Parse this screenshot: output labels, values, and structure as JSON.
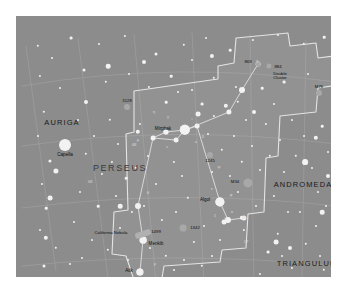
{
  "chart": {
    "background_color": "#8c8c8c",
    "star_color": "#f2f2f2",
    "boundary_color": "#e8e8e8",
    "gridline_color": "#a0a0a0",
    "figure_line_color": "#dcdcdc",
    "nebula_color": "#a8a8a8"
  },
  "constellations": [
    {
      "name": "AURIGA",
      "x": 46,
      "y": 107
    },
    {
      "name": "PERSEUS",
      "x": 104,
      "y": 152
    },
    {
      "name": "ANDROMEDA",
      "x": 287,
      "y": 169
    },
    {
      "name": "TRIANGULUM",
      "x": 291,
      "y": 248
    }
  ],
  "named_stars": [
    {
      "name": "Capella",
      "x": 49,
      "y": 129,
      "r": 6.0,
      "label_dx": 0,
      "label_dy": 10
    },
    {
      "name": "Mirphak",
      "x": 169,
      "y": 114,
      "r": 5.2,
      "label_dx": -22,
      "label_dy": -1
    },
    {
      "name": "Algol",
      "x": 204,
      "y": 186,
      "r": 4.6,
      "label_dx": -15,
      "label_dy": -2
    },
    {
      "name": "Menkib",
      "x": 127,
      "y": 224,
      "r": 3.4,
      "label_dx": 13,
      "label_dy": 4
    },
    {
      "name": "Atik",
      "x": 124,
      "y": 256,
      "r": 3.6,
      "label_dx": -11,
      "label_dy": -1
    }
  ],
  "deep_sky_objects": [
    {
      "name": "1528",
      "x": 111,
      "y": 91,
      "r": 3.0,
      "label_dx": 0,
      "label_dy": -6
    },
    {
      "name": "869",
      "x": 242,
      "y": 48,
      "r": 2.6,
      "label_dx": -10,
      "label_dy": -2
    },
    {
      "name": "884",
      "x": 253,
      "y": 50,
      "r": 2.6,
      "label_dx": 9,
      "label_dy": 1
    },
    {
      "name": "Double\nCluster",
      "x": 253,
      "y": 50,
      "r": 0,
      "label_dx": 11,
      "label_dy": 10
    },
    {
      "name": "M76",
      "x": 303,
      "y": 77,
      "r": 3.0,
      "label_dx": 0,
      "label_dy": -6
    },
    {
      "name": "1245",
      "x": 194,
      "y": 139,
      "r": 3.0,
      "label_dx": 0,
      "label_dy": 6
    },
    {
      "name": "M34",
      "x": 232,
      "y": 167,
      "r": 4.6,
      "label_dx": -13,
      "label_dy": -1
    },
    {
      "name": "1342",
      "x": 167,
      "y": 212,
      "r": 3.4,
      "label_dx": 12,
      "label_dy": 0
    },
    {
      "name": "1499",
      "x": 127,
      "y": 218,
      "r": 0,
      "label_dx": 13,
      "label_dy": -2
    },
    {
      "name": "California Nebula",
      "x": 127,
      "y": 218,
      "r": 0,
      "label_dx": -32,
      "label_dy": -1
    }
  ],
  "bayer_labels": [
    {
      "g": "γ",
      "x": 152,
      "y": 101
    },
    {
      "g": "η",
      "x": 138,
      "y": 96
    },
    {
      "g": "τ",
      "x": 157,
      "y": 124
    },
    {
      "g": "ι",
      "x": 176,
      "y": 103
    },
    {
      "g": "κ",
      "x": 180,
      "y": 126
    },
    {
      "g": "δ",
      "x": 187,
      "y": 121
    },
    {
      "g": "ε",
      "x": 196,
      "y": 173
    },
    {
      "g": "ν",
      "x": 151,
      "y": 131
    },
    {
      "g": "μ",
      "x": 122,
      "y": 124
    },
    {
      "g": "ψ",
      "x": 203,
      "y": 151
    },
    {
      "g": "ξ",
      "x": 199,
      "y": 200
    },
    {
      "g": "ζ",
      "x": 209,
      "y": 203
    },
    {
      "g": "ο",
      "x": 216,
      "y": 196
    },
    {
      "g": "ρ",
      "x": 139,
      "y": 248
    },
    {
      "g": "φ",
      "x": 215,
      "y": 179
    },
    {
      "g": "θ",
      "x": 132,
      "y": 177
    },
    {
      "g": "χ",
      "x": 241,
      "y": 45
    },
    {
      "g": "48",
      "x": 118,
      "y": 129
    },
    {
      "g": "58",
      "x": 74,
      "y": 166
    },
    {
      "g": "16",
      "x": 228,
      "y": 202
    },
    {
      "g": "17",
      "x": 230,
      "y": 226
    },
    {
      "g": "b",
      "x": 129,
      "y": 263
    }
  ],
  "field_stars": [
    {
      "x": 22,
      "y": 30,
      "r": 1.2
    },
    {
      "x": 55,
      "y": 22,
      "r": 1.4
    },
    {
      "x": 83,
      "y": 28,
      "r": 1.0
    },
    {
      "x": 109,
      "y": 20,
      "r": 1.1
    },
    {
      "x": 140,
      "y": 38,
      "r": 1.5
    },
    {
      "x": 168,
      "y": 29,
      "r": 1.2
    },
    {
      "x": 190,
      "y": 22,
      "r": 1.0
    },
    {
      "x": 214,
      "y": 34,
      "r": 1.3
    },
    {
      "x": 237,
      "y": 24,
      "r": 1.1
    },
    {
      "x": 262,
      "y": 19,
      "r": 1.0
    },
    {
      "x": 288,
      "y": 28,
      "r": 1.2
    },
    {
      "x": 308,
      "y": 21,
      "r": 1.3
    },
    {
      "x": 24,
      "y": 60,
      "r": 1.1
    },
    {
      "x": 44,
      "y": 72,
      "r": 1.0
    },
    {
      "x": 68,
      "y": 54,
      "r": 1.5
    },
    {
      "x": 90,
      "y": 66,
      "r": 1.2
    },
    {
      "x": 113,
      "y": 58,
      "r": 1.0
    },
    {
      "x": 133,
      "y": 71,
      "r": 1.1
    },
    {
      "x": 155,
      "y": 60,
      "r": 1.3
    },
    {
      "x": 176,
      "y": 74,
      "r": 1.0
    },
    {
      "x": 198,
      "y": 62,
      "r": 1.2
    },
    {
      "x": 220,
      "y": 71,
      "r": 1.1
    },
    {
      "x": 268,
      "y": 66,
      "r": 1.4
    },
    {
      "x": 292,
      "y": 58,
      "r": 1.0
    },
    {
      "x": 28,
      "y": 96,
      "r": 1.2
    },
    {
      "x": 22,
      "y": 120,
      "r": 1.0
    },
    {
      "x": 34,
      "y": 145,
      "r": 1.6
    },
    {
      "x": 26,
      "y": 168,
      "r": 1.1
    },
    {
      "x": 30,
      "y": 192,
      "r": 1.3
    },
    {
      "x": 24,
      "y": 214,
      "r": 1.0
    },
    {
      "x": 40,
      "y": 232,
      "r": 1.2
    },
    {
      "x": 28,
      "y": 250,
      "r": 1.5
    },
    {
      "x": 54,
      "y": 248,
      "r": 1.0
    },
    {
      "x": 62,
      "y": 104,
      "r": 1.1
    },
    {
      "x": 78,
      "y": 120,
      "r": 1.0
    },
    {
      "x": 70,
      "y": 138,
      "r": 1.2
    },
    {
      "x": 86,
      "y": 158,
      "r": 1.1
    },
    {
      "x": 64,
      "y": 176,
      "r": 1.0
    },
    {
      "x": 82,
      "y": 190,
      "r": 1.3
    },
    {
      "x": 58,
      "y": 206,
      "r": 1.0
    },
    {
      "x": 76,
      "y": 224,
      "r": 1.1
    },
    {
      "x": 66,
      "y": 242,
      "r": 1.0
    },
    {
      "x": 94,
      "y": 104,
      "r": 1.2
    },
    {
      "x": 102,
      "y": 128,
      "r": 1.0
    },
    {
      "x": 96,
      "y": 146,
      "r": 1.1
    },
    {
      "x": 110,
      "y": 162,
      "r": 1.3
    },
    {
      "x": 100,
      "y": 180,
      "r": 1.0
    },
    {
      "x": 116,
      "y": 196,
      "r": 1.1
    },
    {
      "x": 104,
      "y": 212,
      "r": 1.0
    },
    {
      "x": 92,
      "y": 234,
      "r": 1.2
    },
    {
      "x": 112,
      "y": 244,
      "r": 1.0
    },
    {
      "x": 124,
      "y": 108,
      "r": 1.1
    },
    {
      "x": 132,
      "y": 140,
      "r": 1.0
    },
    {
      "x": 120,
      "y": 152,
      "r": 1.2
    },
    {
      "x": 140,
      "y": 168,
      "r": 1.1
    },
    {
      "x": 128,
      "y": 190,
      "r": 1.0
    },
    {
      "x": 146,
      "y": 204,
      "r": 1.1
    },
    {
      "x": 134,
      "y": 232,
      "r": 1.0
    },
    {
      "x": 150,
      "y": 240,
      "r": 1.2
    },
    {
      "x": 158,
      "y": 254,
      "r": 1.0
    },
    {
      "x": 150,
      "y": 86,
      "r": 1.3
    },
    {
      "x": 162,
      "y": 76,
      "r": 1.0
    },
    {
      "x": 158,
      "y": 146,
      "r": 1.1
    },
    {
      "x": 166,
      "y": 160,
      "r": 1.0
    },
    {
      "x": 172,
      "y": 182,
      "r": 1.2
    },
    {
      "x": 160,
      "y": 196,
      "r": 1.0
    },
    {
      "x": 178,
      "y": 226,
      "r": 1.1
    },
    {
      "x": 168,
      "y": 244,
      "r": 1.0
    },
    {
      "x": 186,
      "y": 250,
      "r": 1.2
    },
    {
      "x": 186,
      "y": 88,
      "r": 1.4
    },
    {
      "x": 198,
      "y": 100,
      "r": 1.1
    },
    {
      "x": 192,
      "y": 118,
      "r": 1.0
    },
    {
      "x": 206,
      "y": 134,
      "r": 1.2
    },
    {
      "x": 196,
      "y": 156,
      "r": 1.0
    },
    {
      "x": 214,
      "y": 160,
      "r": 1.1
    },
    {
      "x": 188,
      "y": 210,
      "r": 1.0
    },
    {
      "x": 204,
      "y": 224,
      "r": 1.1
    },
    {
      "x": 196,
      "y": 240,
      "r": 1.0
    },
    {
      "x": 222,
      "y": 86,
      "r": 1.2
    },
    {
      "x": 230,
      "y": 104,
      "r": 1.0
    },
    {
      "x": 218,
      "y": 120,
      "r": 1.1
    },
    {
      "x": 236,
      "y": 130,
      "r": 1.0
    },
    {
      "x": 226,
      "y": 146,
      "r": 1.2
    },
    {
      "x": 244,
      "y": 154,
      "r": 1.0
    },
    {
      "x": 222,
      "y": 176,
      "r": 1.1
    },
    {
      "x": 240,
      "y": 190,
      "r": 1.0
    },
    {
      "x": 228,
      "y": 214,
      "r": 1.1
    },
    {
      "x": 246,
      "y": 72,
      "r": 1.3
    },
    {
      "x": 258,
      "y": 88,
      "r": 1.0
    },
    {
      "x": 250,
      "y": 108,
      "r": 1.1
    },
    {
      "x": 264,
      "y": 124,
      "r": 1.0
    },
    {
      "x": 254,
      "y": 140,
      "r": 1.2
    },
    {
      "x": 268,
      "y": 156,
      "r": 1.0
    },
    {
      "x": 258,
      "y": 180,
      "r": 1.1
    },
    {
      "x": 272,
      "y": 196,
      "r": 1.0
    },
    {
      "x": 262,
      "y": 218,
      "r": 1.2
    },
    {
      "x": 276,
      "y": 104,
      "r": 1.1
    },
    {
      "x": 288,
      "y": 120,
      "r": 1.0
    },
    {
      "x": 280,
      "y": 140,
      "r": 1.2
    },
    {
      "x": 296,
      "y": 152,
      "r": 1.0
    },
    {
      "x": 284,
      "y": 196,
      "r": 1.1
    },
    {
      "x": 300,
      "y": 210,
      "r": 1.0
    },
    {
      "x": 290,
      "y": 228,
      "r": 1.2
    },
    {
      "x": 304,
      "y": 240,
      "r": 1.0
    },
    {
      "x": 276,
      "y": 252,
      "r": 1.1
    },
    {
      "x": 306,
      "y": 110,
      "r": 1.3
    },
    {
      "x": 312,
      "y": 136,
      "r": 1.0
    },
    {
      "x": 302,
      "y": 176,
      "r": 1.1
    },
    {
      "x": 310,
      "y": 190,
      "r": 1.0
    },
    {
      "x": 308,
      "y": 254,
      "r": 1.2
    },
    {
      "x": 292,
      "y": 268,
      "r": 1.0
    },
    {
      "x": 46,
      "y": 262,
      "r": 1.1
    },
    {
      "x": 88,
      "y": 268,
      "r": 1.0
    },
    {
      "x": 140,
      "y": 272,
      "r": 1.2
    },
    {
      "x": 200,
      "y": 266,
      "r": 1.0
    },
    {
      "x": 244,
      "y": 258,
      "r": 1.1
    },
    {
      "x": 176,
      "y": 44,
      "r": 1.0
    },
    {
      "x": 36,
      "y": 42,
      "r": 1.0
    },
    {
      "x": 252,
      "y": 236,
      "r": 1.4
    },
    {
      "x": 266,
      "y": 240,
      "r": 1.0
    }
  ],
  "bright_field_stars": [
    {
      "x": 40,
      "y": 155,
      "r": 2.6
    },
    {
      "x": 34,
      "y": 182,
      "r": 2.4
    },
    {
      "x": 30,
      "y": 222,
      "r": 2.2
    },
    {
      "x": 92,
      "y": 50,
      "r": 2.3
    },
    {
      "x": 128,
      "y": 46,
      "r": 2.0
    },
    {
      "x": 196,
      "y": 40,
      "r": 2.1
    },
    {
      "x": 289,
      "y": 146,
      "r": 2.9
    },
    {
      "x": 300,
      "y": 122,
      "r": 2.2
    },
    {
      "x": 312,
      "y": 160,
      "r": 2.0
    },
    {
      "x": 260,
      "y": 226,
      "r": 2.4
    },
    {
      "x": 274,
      "y": 232,
      "r": 2.0
    },
    {
      "x": 306,
      "y": 196,
      "r": 2.3
    },
    {
      "x": 182,
      "y": 98,
      "r": 2.4
    },
    {
      "x": 210,
      "y": 90,
      "r": 2.2
    },
    {
      "x": 238,
      "y": 96,
      "r": 2.0
    },
    {
      "x": 150,
      "y": 116,
      "r": 2.5
    },
    {
      "x": 122,
      "y": 116,
      "r": 2.2
    },
    {
      "x": 104,
      "y": 190,
      "r": 2.3
    },
    {
      "x": 208,
      "y": 206,
      "r": 2.4
    },
    {
      "x": 226,
      "y": 202,
      "r": 2.2
    },
    {
      "x": 70,
      "y": 86,
      "r": 2.0
    }
  ],
  "figure_stars": [
    {
      "x": 242,
      "y": 48,
      "r": 2.4
    },
    {
      "x": 226,
      "y": 74,
      "r": 3.0
    },
    {
      "x": 213,
      "y": 96,
      "r": 2.6
    },
    {
      "x": 169,
      "y": 114,
      "r": 5.2
    },
    {
      "x": 150,
      "y": 116,
      "r": 2.6
    },
    {
      "x": 137,
      "y": 122,
      "r": 2.4
    },
    {
      "x": 122,
      "y": 190,
      "r": 3.0
    },
    {
      "x": 127,
      "y": 224,
      "r": 3.4
    },
    {
      "x": 124,
      "y": 256,
      "r": 3.6
    },
    {
      "x": 204,
      "y": 186,
      "r": 4.6
    },
    {
      "x": 212,
      "y": 204,
      "r": 3.0
    },
    {
      "x": 228,
      "y": 202,
      "r": 2.6
    },
    {
      "x": 160,
      "y": 124,
      "r": 2.4
    },
    {
      "x": 181,
      "y": 110,
      "r": 2.4
    }
  ],
  "figure_lines": [
    [
      [
        242,
        48
      ],
      [
        226,
        74
      ]
    ],
    [
      [
        226,
        74
      ],
      [
        213,
        96
      ]
    ],
    [
      [
        213,
        96
      ],
      [
        169,
        114
      ]
    ],
    [
      [
        169,
        114
      ],
      [
        150,
        116
      ]
    ],
    [
      [
        150,
        116
      ],
      [
        137,
        122
      ]
    ],
    [
      [
        137,
        122
      ],
      [
        122,
        190
      ]
    ],
    [
      [
        122,
        190
      ],
      [
        127,
        224
      ]
    ],
    [
      [
        127,
        224
      ],
      [
        124,
        256
      ]
    ],
    [
      [
        169,
        114
      ],
      [
        181,
        110
      ]
    ],
    [
      [
        181,
        110
      ],
      [
        204,
        186
      ]
    ],
    [
      [
        204,
        186
      ],
      [
        212,
        204
      ]
    ],
    [
      [
        212,
        204
      ],
      [
        228,
        202
      ]
    ],
    [
      [
        169,
        114
      ],
      [
        160,
        124
      ]
    ],
    [
      [
        160,
        124
      ],
      [
        137,
        122
      ]
    ]
  ],
  "boundary_path": "M 118,75 L 132,73 L 202,63 L 202,50 L 218,47 L 220,22 L 272,17 L 274,30 L 300,27 L 302,42 L 318,40 L 316,70 L 302,72 L 300,96 L 264,100 L 262,140 L 250,142 L 248,196 L 232,198 L 230,232 L 206,234 L 204,246 L 148,250 L 146,262 L 118,264 L 110,240 L 96,238 L 98,196 L 112,194 L 110,118 L 118,116 Z",
  "gridlines_ra": [
    "M 10,30 L 40,255",
    "M 62,22 L 92,262",
    "M 118,18 L 140,268",
    "M 176,16 L 188,270",
    "M 234,18 L 238,268",
    "M 290,24 L 286,262"
  ],
  "gridlines_dec": [
    "M 6,70 Q 160,44 320,66",
    "M 6,130 Q 160,108 320,128",
    "M 6,192 Q 160,172 320,190",
    "M 6,250 Q 160,234 320,250"
  ]
}
